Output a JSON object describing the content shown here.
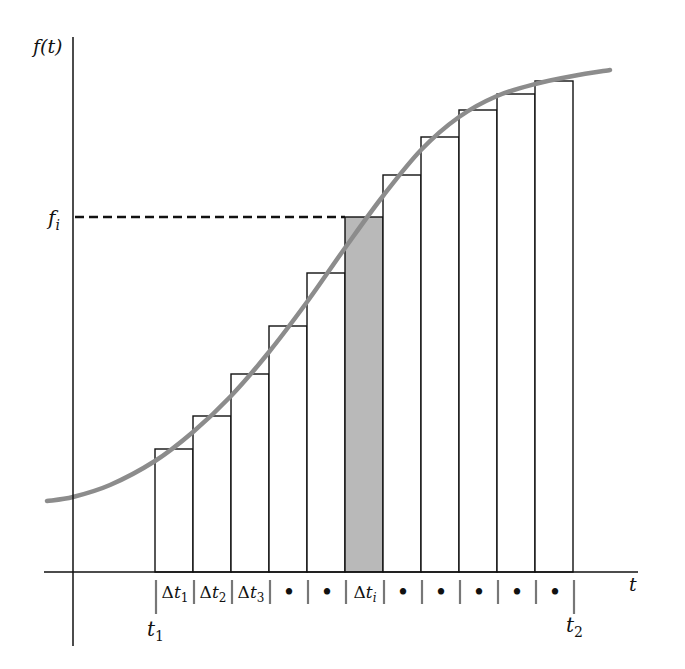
{
  "figure": {
    "y_axis_label": "f(t)",
    "x_axis_label": "t",
    "fi_label": "f",
    "fi_sub": "i",
    "t1_label": "t",
    "t1_sub": "1",
    "t2_label": "t",
    "t2_sub": "2",
    "delta_labels": [
      {
        "text": "Δt",
        "sub": "1"
      },
      {
        "text": "Δt",
        "sub": "2"
      },
      {
        "text": "Δt",
        "sub": "3"
      },
      {
        "text": "•",
        "sub": ""
      },
      {
        "text": "•",
        "sub": ""
      },
      {
        "text": "Δt",
        "sub": "i"
      },
      {
        "text": "•",
        "sub": ""
      },
      {
        "text": "•",
        "sub": ""
      },
      {
        "text": "•",
        "sub": ""
      },
      {
        "text": "•",
        "sub": ""
      },
      {
        "text": "•",
        "sub": ""
      }
    ],
    "colors": {
      "curve": "#8c8c8c",
      "shaded_bar": "#b9b9b9",
      "axis": "#111111",
      "separator": "#777777"
    }
  },
  "chart_data": {
    "type": "bar",
    "title": "",
    "xlabel": "t",
    "ylabel": "f(t)",
    "categories": [
      "Δt1",
      "Δt2",
      "Δt3",
      "•",
      "•",
      "Δti",
      "•",
      "•",
      "•",
      "•",
      "•"
    ],
    "values": [
      123,
      156,
      198,
      246,
      299,
      355,
      397,
      435,
      462,
      478,
      491
    ],
    "highlight_index": 5,
    "highlight_label": "f_i",
    "curve_points": [
      [
        0,
        71
      ],
      [
        26,
        75
      ],
      [
        63,
        87
      ],
      [
        108,
        111
      ],
      [
        146,
        140
      ],
      [
        184,
        176
      ],
      [
        222,
        220
      ],
      [
        260,
        270
      ],
      [
        298,
        324
      ],
      [
        336,
        376
      ],
      [
        374,
        422
      ],
      [
        412,
        455
      ],
      [
        450,
        476
      ],
      [
        488,
        488
      ],
      [
        526,
        496
      ],
      [
        563,
        502
      ]
    ],
    "x_range_labels": [
      "t1",
      "t2"
    ],
    "grid": false
  }
}
